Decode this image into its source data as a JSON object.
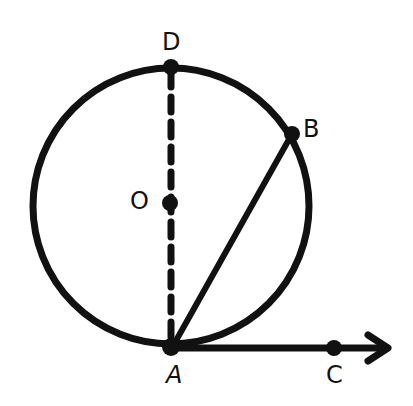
{
  "diagram": {
    "type": "geometry",
    "colors": {
      "stroke": "#111111",
      "background": "#ffffff"
    },
    "circle": {
      "center": "O",
      "cx": 171,
      "cy": 206,
      "r": 139
    },
    "points": {
      "D": {
        "label": "D",
        "x": 171,
        "y": 67
      },
      "O": {
        "label": "O",
        "x": 171,
        "y": 204
      },
      "B": {
        "label": "B",
        "x": 292,
        "y": 133
      },
      "A": {
        "label": "A",
        "x": 171,
        "y": 347
      },
      "C": {
        "label": "C",
        "x": 334,
        "y": 348
      }
    },
    "segments": [
      {
        "name": "diameter-DA",
        "from": "D",
        "to": "A",
        "style": "dashed"
      },
      {
        "name": "chord-AB",
        "from": "A",
        "to": "B",
        "style": "solid"
      }
    ],
    "rays": [
      {
        "name": "ray-AC",
        "from": "A",
        "through": "C",
        "style": "solid-arrow"
      }
    ]
  }
}
